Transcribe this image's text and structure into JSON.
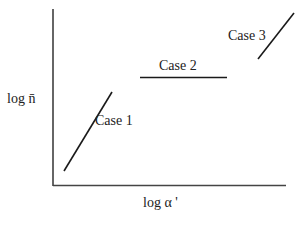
{
  "diagram": {
    "axes": {
      "y_label": "log n̄",
      "x_label": "log  α '"
    },
    "cases": [
      {
        "label": "Case 1",
        "type": "rising-line"
      },
      {
        "label": "Case 2",
        "type": "horizontal-line"
      },
      {
        "label": "Case 3",
        "type": "rising-line"
      }
    ],
    "colors": {
      "line": "#1a1a1a",
      "axis": "#333333",
      "text": "#222222"
    }
  }
}
